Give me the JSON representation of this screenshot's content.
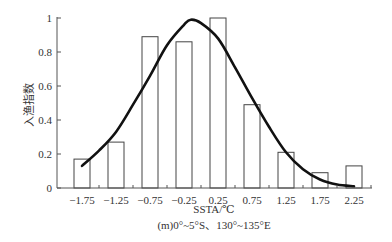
{
  "chart_data": {
    "type": "bar",
    "title": "",
    "xlabel": "SSTA/℃",
    "subtitle": "(m)0°~5°S、130°~135°E",
    "ylabel": "入渔指数",
    "categories": [
      "-1.75",
      "-1.25",
      "-0.75",
      "-0.25",
      "0.25",
      "0.75",
      "1.25",
      "1.75",
      "2.25"
    ],
    "values": [
      0.17,
      0.27,
      0.89,
      0.86,
      1.0,
      0.49,
      0.21,
      0.09,
      0.13
    ],
    "ylim": [
      0,
      1
    ],
    "yticks": [
      "0",
      "0.2",
      "0.4",
      "0.6",
      "0.8",
      "1"
    ],
    "grid": false,
    "legend": null,
    "fitted_curve": {
      "type": "line",
      "description": "Gaussian fit",
      "x": [
        -1.75,
        -1.5,
        -1.25,
        -1.0,
        -0.75,
        -0.5,
        -0.25,
        -0.15,
        0.0,
        0.25,
        0.5,
        0.75,
        1.0,
        1.25,
        1.5,
        1.75,
        2.0,
        2.25
      ],
      "y": [
        0.13,
        0.22,
        0.33,
        0.49,
        0.66,
        0.84,
        0.96,
        0.99,
        0.97,
        0.88,
        0.71,
        0.53,
        0.36,
        0.21,
        0.11,
        0.05,
        0.02,
        0.01
      ]
    }
  }
}
